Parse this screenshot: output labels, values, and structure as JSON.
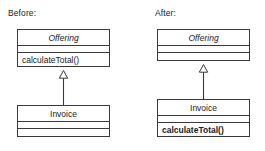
{
  "figure": {
    "type": "uml-class-diagram",
    "background_color": "#ffffff",
    "line_color": "#3a3a3a",
    "text_color": "#1a1a1a"
  },
  "panels": [
    {
      "caption": "Before:",
      "classes": [
        {
          "name": "Offering",
          "abstract": true,
          "attributes": [],
          "operations": [
            "calculateTotal()"
          ],
          "operations_bold": false
        },
        {
          "name": "Invoice",
          "abstract": false,
          "attributes": [],
          "operations": [],
          "operations_bold": false
        }
      ],
      "relationship": {
        "type": "generalization",
        "from": "Invoice",
        "to": "Offering",
        "arrowhead": "hollow-triangle"
      }
    },
    {
      "caption": "After:",
      "classes": [
        {
          "name": "Offering",
          "abstract": true,
          "attributes": [],
          "operations": [],
          "operations_bold": false
        },
        {
          "name": "Invoice",
          "abstract": false,
          "attributes": [],
          "operations": [
            "calculateTotal()"
          ],
          "operations_bold": true
        }
      ],
      "relationship": {
        "type": "generalization",
        "from": "Invoice",
        "to": "Offering",
        "arrowhead": "hollow-triangle"
      }
    }
  ],
  "labels": {
    "before_caption": "Before:",
    "after_caption": "After:",
    "offering_class": "Offering",
    "invoice_class": "Invoice",
    "calculate_total_operation": "calculateTotal()"
  }
}
